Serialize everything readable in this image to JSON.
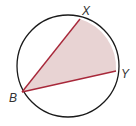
{
  "diagram": {
    "type": "circle-inscribed-angle",
    "circle": {
      "cx": 68,
      "cy": 66,
      "r": 51,
      "stroke": "#1a1a1a"
    },
    "points": [
      {
        "name": "X",
        "x": 80,
        "y": 19,
        "label_x": 82,
        "label_y": 15
      },
      {
        "name": "Y",
        "x": 116,
        "y": 71,
        "label_x": 121,
        "label_y": 78
      },
      {
        "name": "B",
        "x": 22,
        "y": 92,
        "label_x": 9,
        "label_y": 102
      }
    ],
    "chord_color": "#a8283a",
    "fill_color": "#e8d3d3",
    "shaded_region": "sector from B bounded by chords BX, BY and arc XY"
  }
}
